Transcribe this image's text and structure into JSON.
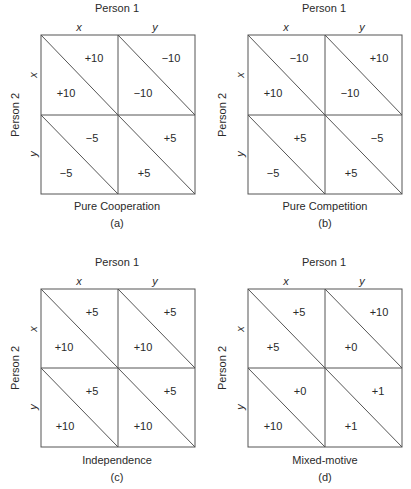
{
  "figure": {
    "colors": {
      "line": "#555555",
      "text": "#2a2a2a",
      "background": "#ffffff"
    },
    "panels": [
      {
        "id": "a",
        "person1_label": "Person 1",
        "person2_label": "Person 2",
        "col_labels": [
          "x",
          "y"
        ],
        "row_labels": [
          "x",
          "y"
        ],
        "title": "Pure Cooperation",
        "letter": "(a)",
        "cells": [
          {
            "row": "x",
            "col": "x",
            "person1": "+10",
            "person2": "+10"
          },
          {
            "row": "x",
            "col": "y",
            "person1": "−10",
            "person2": "−10"
          },
          {
            "row": "y",
            "col": "x",
            "person1": "−5",
            "person2": "−5"
          },
          {
            "row": "y",
            "col": "y",
            "person1": "+5",
            "person2": "+5"
          }
        ]
      },
      {
        "id": "b",
        "person1_label": "Person 1",
        "person2_label": "Person 2",
        "col_labels": [
          "x",
          "y"
        ],
        "row_labels": [
          "x",
          "y"
        ],
        "title": "Pure Competition",
        "letter": "(b)",
        "cells": [
          {
            "row": "x",
            "col": "x",
            "person1": "−10",
            "person2": "+10"
          },
          {
            "row": "x",
            "col": "y",
            "person1": "+10",
            "person2": "−10"
          },
          {
            "row": "y",
            "col": "x",
            "person1": "+5",
            "person2": "−5"
          },
          {
            "row": "y",
            "col": "y",
            "person1": "−5",
            "person2": "+5"
          }
        ]
      },
      {
        "id": "c",
        "person1_label": "Person 1",
        "person2_label": "Person 2",
        "col_labels": [
          "x",
          "y"
        ],
        "row_labels": [
          "x",
          "y"
        ],
        "title": "Independence",
        "letter": "(c)",
        "cells": [
          {
            "row": "x",
            "col": "x",
            "person1": "+5",
            "person2": "+10"
          },
          {
            "row": "x",
            "col": "y",
            "person1": "+5",
            "person2": "+10"
          },
          {
            "row": "y",
            "col": "x",
            "person1": "+5",
            "person2": "+10"
          },
          {
            "row": "y",
            "col": "y",
            "person1": "+5",
            "person2": "+10"
          }
        ]
      },
      {
        "id": "d",
        "person1_label": "Person 1",
        "person2_label": "Person 2",
        "col_labels": [
          "x",
          "y"
        ],
        "row_labels": [
          "x",
          "y"
        ],
        "title": "Mixed-motive",
        "letter": "(d)",
        "cells": [
          {
            "row": "x",
            "col": "x",
            "person1": "+5",
            "person2": "+5"
          },
          {
            "row": "x",
            "col": "y",
            "person1": "+10",
            "person2": "+0"
          },
          {
            "row": "y",
            "col": "x",
            "person1": "+0",
            "person2": "+10"
          },
          {
            "row": "y",
            "col": "y",
            "person1": "+1",
            "person2": "+1"
          }
        ]
      }
    ]
  }
}
